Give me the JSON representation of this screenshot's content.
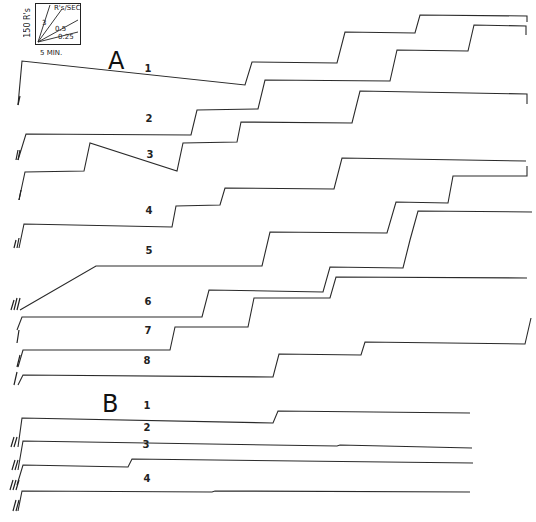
{
  "chart_data": {
    "type": "line",
    "legend": {
      "y_scale": "150 R's",
      "x_scale": "5 MIN.",
      "rate_title": "R's/SEC",
      "rate_lines": [
        "3",
        "0.5",
        "0.25"
      ]
    },
    "panels": [
      {
        "name": "A",
        "series": [
          {
            "name": "1",
            "points": [
              [
                18,
                105
              ],
              [
                22,
                61
              ],
              [
                245,
                85
              ],
              [
                252,
                62
              ],
              [
                337,
                63
              ],
              [
                345,
                32
              ],
              [
                415,
                33
              ],
              [
                420,
                15
              ],
              [
                527,
                16
              ],
              [
                527,
                22
              ]
            ]
          },
          {
            "name": "2",
            "points": [
              [
                18,
                160
              ],
              [
                26,
                134
              ],
              [
                191,
                135
              ],
              [
                197,
                110
              ],
              [
                258,
                109
              ],
              [
                265,
                80
              ],
              [
                390,
                81
              ],
              [
                397,
                50
              ],
              [
                468,
                51
              ],
              [
                474,
                25
              ],
              [
                526,
                26
              ],
              [
                526,
                35
              ]
            ]
          },
          {
            "name": "3",
            "points": [
              [
                19,
                200
              ],
              [
                25,
                172
              ],
              [
                84,
                171
              ],
              [
                90,
                143
              ],
              [
                177,
                171
              ],
              [
                183,
                143
              ],
              [
                237,
                142
              ],
              [
                241,
                122
              ],
              [
                352,
                123
              ],
              [
                360,
                91
              ],
              [
                527,
                94
              ],
              [
                527,
                104
              ]
            ]
          },
          {
            "name": "4",
            "points": [
              [
                19,
                248
              ],
              [
                24,
                224
              ],
              [
                172,
                227
              ],
              [
                176,
                206
              ],
              [
                220,
                205
              ],
              [
                225,
                188
              ],
              [
                334,
                189
              ],
              [
                342,
                158
              ],
              [
                526,
                161
              ]
            ]
          },
          {
            "name": "5",
            "points": [
              [
                20,
                310
              ],
              [
                96,
                266
              ],
              [
                262,
                266
              ],
              [
                270,
                232
              ],
              [
                387,
                233
              ],
              [
                396,
                202
              ],
              [
                448,
                203
              ],
              [
                453,
                176
              ],
              [
                527,
                176
              ],
              [
                527,
                166
              ]
            ]
          },
          {
            "name": "6",
            "points": [
              [
                17,
                330
              ],
              [
                22,
                317
              ],
              [
                202,
                317
              ],
              [
                209,
                290
              ],
              [
                323,
                292
              ],
              [
                330,
                267
              ],
              [
                403,
                268
              ],
              [
                410,
                240
              ],
              [
                418,
                211
              ],
              [
                532,
                212
              ]
            ]
          },
          {
            "name": "7",
            "points": [
              [
                18,
                367
              ],
              [
                23,
                350
              ],
              [
                170,
                350
              ],
              [
                175,
                327
              ],
              [
                248,
                327
              ],
              [
                254,
                298
              ],
              [
                330,
                298
              ],
              [
                336,
                277
              ],
              [
                527,
                278
              ]
            ]
          },
          {
            "name": "8",
            "points": [
              [
                18,
                385
              ],
              [
                23,
                375
              ],
              [
                273,
                377
              ],
              [
                279,
                354
              ],
              [
                361,
                355
              ],
              [
                365,
                342
              ],
              [
                525,
                344
              ],
              [
                531,
                318
              ]
            ]
          }
        ]
      },
      {
        "name": "B",
        "series": [
          {
            "name": "1",
            "points": [
              [
                18,
                447
              ],
              [
                22,
                418
              ],
              [
                273,
                423
              ],
              [
                278,
                411
              ],
              [
                470,
                413
              ]
            ]
          },
          {
            "name": "2",
            "points": [
              [
                18,
                470
              ],
              [
                23,
                441
              ],
              [
                337,
                446
              ],
              [
                340,
                445
              ],
              [
                472,
                448
              ]
            ]
          },
          {
            "name": "3",
            "points": [
              [
                17,
                485
              ],
              [
                23,
                465
              ],
              [
                128,
                467
              ],
              [
                132,
                459
              ],
              [
                473,
                463
              ]
            ]
          },
          {
            "name": "4",
            "points": [
              [
                18,
                511
              ],
              [
                22,
                491
              ],
              [
                212,
                492
              ],
              [
                215,
                491
              ],
              [
                470,
                492
              ]
            ]
          }
        ]
      }
    ],
    "labels": [
      {
        "text": "1",
        "panel": "A",
        "x": 148,
        "y": 71
      },
      {
        "text": "2",
        "panel": "A",
        "x": 149,
        "y": 121
      },
      {
        "text": "3",
        "panel": "A",
        "x": 150,
        "y": 157
      },
      {
        "text": "4",
        "panel": "A",
        "x": 149,
        "y": 213
      },
      {
        "text": "5",
        "panel": "A",
        "x": 149,
        "y": 253
      },
      {
        "text": "6",
        "panel": "A",
        "x": 148,
        "y": 304
      },
      {
        "text": "7",
        "panel": "A",
        "x": 148,
        "y": 333
      },
      {
        "text": "8",
        "panel": "A",
        "x": 147,
        "y": 363
      },
      {
        "text": "1",
        "panel": "B",
        "x": 147,
        "y": 408
      },
      {
        "text": "2",
        "panel": "B",
        "x": 147,
        "y": 430
      },
      {
        "text": "3",
        "panel": "B",
        "x": 146,
        "y": 447
      },
      {
        "text": "4",
        "panel": "B",
        "x": 147,
        "y": 481
      }
    ],
    "xlabel": "Time",
    "ylabel": "Cumulative responses",
    "grid": false
  },
  "panel_labels": {
    "a": "A",
    "b": "B"
  }
}
